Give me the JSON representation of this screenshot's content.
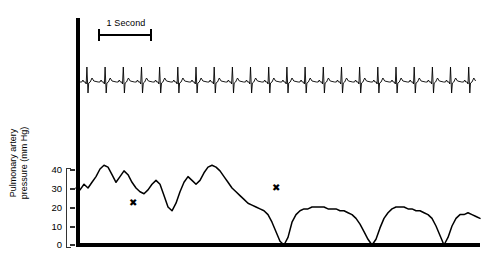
{
  "figure": {
    "kind": "physiologic-recording",
    "timebar": {
      "label": "1 Second",
      "seconds": 1
    },
    "marker_glyph": "✖"
  },
  "chart_data": {
    "type": "line",
    "title": "",
    "xlabel": "",
    "ylabel": "Pulmonary artery pressure (mm Hg)",
    "ylim": [
      0,
      45
    ],
    "yticks": [
      0,
      10,
      20,
      30,
      40
    ],
    "ytick_labels": [
      "0",
      "10",
      "20",
      "30",
      "40"
    ],
    "grid": false,
    "legend": null,
    "annotations": [
      {
        "label": "✖",
        "x_px": 133,
        "y_value": 22
      },
      {
        "label": "✖",
        "x_px": 276,
        "y_value": 30
      }
    ],
    "series": [
      {
        "name": "ECG",
        "units": "mV",
        "axis": "top",
        "beats": 22,
        "description": "regular sinus rhythm, tall R wave with deep S wave and small T wave"
      },
      {
        "name": "Pulmonary artery pressure",
        "units": "mm Hg",
        "axis": "bottom",
        "x": [
          76,
          80,
          84,
          88,
          92,
          96,
          100,
          104,
          108,
          112,
          116,
          120,
          124,
          128,
          132,
          136,
          140,
          144,
          148,
          152,
          156,
          160,
          164,
          168,
          172,
          176,
          180,
          184,
          188,
          192,
          196,
          200,
          204,
          208,
          212,
          216,
          220,
          224,
          228,
          232,
          236,
          240,
          244,
          248,
          252,
          256,
          260,
          264,
          268,
          272,
          276,
          280,
          284,
          288,
          292,
          296,
          300,
          304,
          308,
          312,
          316,
          320,
          324,
          328,
          332,
          336,
          340,
          344,
          348,
          352,
          356,
          360,
          364,
          368,
          372,
          376,
          380,
          384,
          388,
          392,
          396,
          400,
          404,
          408,
          412,
          416,
          420,
          424,
          428,
          432,
          436,
          440,
          444,
          448,
          452,
          456,
          460,
          464,
          468,
          472,
          476,
          480
        ],
        "values": [
          30,
          29,
          32,
          30,
          33,
          36,
          40,
          42,
          41,
          37,
          33,
          36,
          39,
          37,
          33,
          30,
          28,
          27,
          29,
          32,
          34,
          32,
          26,
          20,
          18,
          22,
          28,
          33,
          36,
          34,
          32,
          34,
          38,
          41,
          42,
          41,
          39,
          36,
          33,
          30,
          28,
          26,
          24,
          22,
          21,
          20,
          19,
          18,
          16,
          12,
          7,
          2,
          0,
          4,
          12,
          16,
          18,
          19,
          19,
          20,
          20,
          20,
          20,
          19,
          19,
          19,
          18,
          18,
          17,
          16,
          14,
          11,
          7,
          3,
          0,
          3,
          9,
          14,
          17,
          19,
          20,
          20,
          20,
          19,
          19,
          18,
          18,
          17,
          16,
          14,
          10,
          5,
          0,
          4,
          10,
          14,
          16,
          16,
          17,
          16,
          15,
          14
        ]
      }
    ]
  }
}
